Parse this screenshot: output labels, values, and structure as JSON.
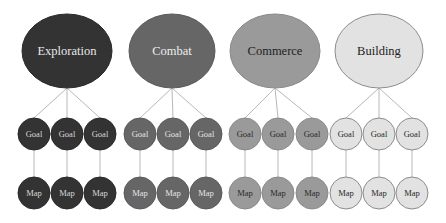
{
  "diagram": {
    "line_color": "#b8b8b8",
    "groups": [
      {
        "label": "Exploration",
        "fill": "#333333",
        "stroke": "#2a2a2a",
        "text_color": "#e8e8e8",
        "small_text_color": "#d8d8d8",
        "cx": 67,
        "cy": 51,
        "rx": 45,
        "ry": 37,
        "children_x": [
          34,
          67,
          100
        ],
        "goal_label": "Goal",
        "map_label": "Map"
      },
      {
        "label": "Combat",
        "fill": "#666666",
        "stroke": "#5a5a5a",
        "text_color": "#eeeeee",
        "small_text_color": "#e4e4e4",
        "cx": 172,
        "cy": 51,
        "rx": 43,
        "ry": 37,
        "children_x": [
          140,
          173,
          206
        ],
        "goal_label": "Goal",
        "map_label": "Map"
      },
      {
        "label": "Commerce",
        "fill": "#9a9a9a",
        "stroke": "#8a8a8a",
        "text_color": "#222222",
        "small_text_color": "#2a2a2a",
        "cx": 275,
        "cy": 51,
        "rx": 45,
        "ry": 37,
        "children_x": [
          245,
          278,
          312
        ],
        "goal_label": "Goal",
        "map_label": "Map"
      },
      {
        "label": "Building",
        "fill": "#e2e2e2",
        "stroke": "#8c8c8c",
        "text_color": "#222222",
        "small_text_color": "#2a2a2a",
        "cx": 379,
        "cy": 51,
        "rx": 44,
        "ry": 37,
        "children_x": [
          346,
          379,
          412
        ],
        "goal_label": "Goal",
        "map_label": "Map"
      }
    ],
    "goal_row_y": 134,
    "map_row_y": 193,
    "small_r": 16
  }
}
